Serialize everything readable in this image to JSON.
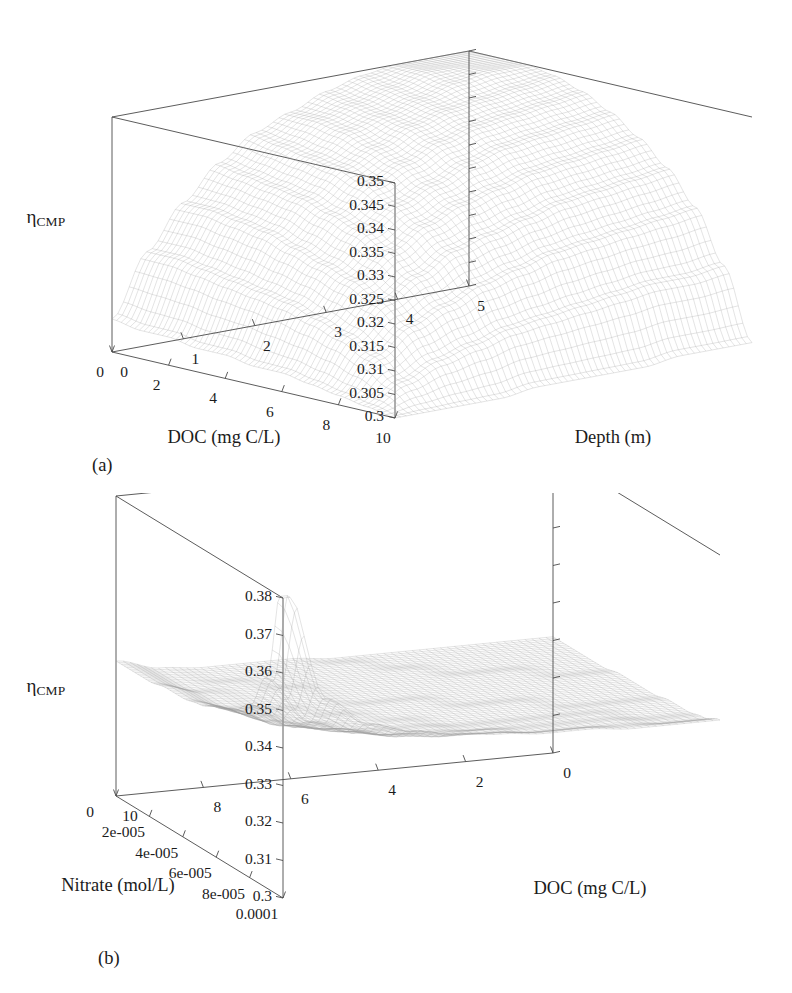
{
  "figure": {
    "background": "#ffffff",
    "ink": "#1b1b1b",
    "mesh_color": "#9a9a9a",
    "axis_color": "#4a4a4a"
  },
  "panels": [
    {
      "id": "a",
      "panel_label": "(a)",
      "z_axis_label_main": "η",
      "z_axis_label_sub": "CMP",
      "left_axis_title": "DOC (mg C/L)",
      "right_axis_title": "Depth (m)",
      "z_ticks": [
        "0.3",
        "0.305",
        "0.31",
        "0.315",
        "0.32",
        "0.325",
        "0.33",
        "0.335",
        "0.34",
        "0.345",
        "0.35"
      ],
      "left_ticks": [
        "10",
        "8",
        "6",
        "4",
        "2",
        "0"
      ],
      "right_ticks": [
        "0",
        "1",
        "2",
        "3",
        "4",
        "5"
      ],
      "chart_data": {
        "type": "surface",
        "title": "",
        "xlabel": "DOC (mg C/L)",
        "ylabel": "Depth (m)",
        "zlabel": "ηCMP",
        "xlim": [
          0,
          10
        ],
        "ylim": [
          0,
          5
        ],
        "zlim": [
          0.3,
          0.35
        ],
        "x_ticks": [
          0,
          2,
          4,
          6,
          8,
          10
        ],
        "y_ticks": [
          0,
          1,
          2,
          3,
          4,
          5
        ],
        "z_ticks": [
          0.3,
          0.305,
          0.31,
          0.315,
          0.32,
          0.325,
          0.33,
          0.335,
          0.34,
          0.345,
          0.35
        ],
        "grid": false,
        "legend": "none",
        "x": [
          0,
          1,
          2,
          3,
          4,
          5,
          6,
          7,
          8,
          9,
          10
        ],
        "y": [
          0,
          0.5,
          1,
          1.5,
          2,
          2.5,
          3,
          3.5,
          4,
          4.5,
          5
        ],
        "z_matrix_note": "rows = DOC (0..10), cols = Depth (0..5); eta_CMP rises from 0.300 at DOC=0,Depth=0 to ~0.350 at DOC=10,Depth=5",
        "z": [
          [
            0.3,
            0.3,
            0.3,
            0.3,
            0.301,
            0.301,
            0.301,
            0.301,
            0.302,
            0.302,
            0.302
          ],
          [
            0.301,
            0.305,
            0.308,
            0.31,
            0.312,
            0.313,
            0.314,
            0.315,
            0.316,
            0.316,
            0.317
          ],
          [
            0.302,
            0.309,
            0.314,
            0.317,
            0.32,
            0.322,
            0.324,
            0.325,
            0.326,
            0.327,
            0.328
          ],
          [
            0.303,
            0.312,
            0.318,
            0.322,
            0.326,
            0.328,
            0.33,
            0.332,
            0.333,
            0.334,
            0.335
          ],
          [
            0.304,
            0.314,
            0.321,
            0.326,
            0.33,
            0.333,
            0.335,
            0.337,
            0.338,
            0.339,
            0.34
          ],
          [
            0.304,
            0.316,
            0.323,
            0.329,
            0.333,
            0.336,
            0.339,
            0.341,
            0.342,
            0.343,
            0.344
          ],
          [
            0.305,
            0.317,
            0.325,
            0.331,
            0.336,
            0.339,
            0.342,
            0.344,
            0.345,
            0.346,
            0.347
          ],
          [
            0.305,
            0.318,
            0.327,
            0.333,
            0.338,
            0.341,
            0.344,
            0.346,
            0.347,
            0.348,
            0.349
          ],
          [
            0.306,
            0.319,
            0.328,
            0.334,
            0.339,
            0.343,
            0.345,
            0.347,
            0.349,
            0.35,
            0.35
          ],
          [
            0.306,
            0.32,
            0.329,
            0.335,
            0.34,
            0.344,
            0.346,
            0.348,
            0.35,
            0.35,
            0.35
          ],
          [
            0.307,
            0.32,
            0.329,
            0.336,
            0.341,
            0.344,
            0.347,
            0.349,
            0.35,
            0.35,
            0.35
          ]
        ]
      }
    },
    {
      "id": "b",
      "panel_label": "(b)",
      "z_axis_label_main": "η",
      "z_axis_label_sub": "CMP",
      "left_axis_title": "Nitrate (mol/L)",
      "right_axis_title": "DOC (mg C/L)",
      "z_ticks": [
        "0.3",
        "0.31",
        "0.32",
        "0.33",
        "0.34",
        "0.35",
        "0.36",
        "0.37",
        "0.38"
      ],
      "left_ticks": [
        "0.0001",
        "8e-005",
        "6e-005",
        "4e-005",
        "2e-005",
        "0"
      ],
      "right_ticks": [
        "10",
        "8",
        "6",
        "4",
        "2",
        "0"
      ],
      "chart_data": {
        "type": "surface",
        "title": "",
        "xlabel": "Nitrate (mol/L)",
        "ylabel": "DOC (mg C/L)",
        "zlabel": "ηCMP",
        "xlim": [
          0,
          0.0001
        ],
        "ylim": [
          0,
          10
        ],
        "zlim": [
          0.3,
          0.38
        ],
        "x_ticks": [
          0,
          2e-05,
          4e-05,
          6e-05,
          8e-05,
          0.0001
        ],
        "y_ticks": [
          0,
          2,
          4,
          6,
          8,
          10
        ],
        "z_ticks": [
          0.3,
          0.31,
          0.32,
          0.33,
          0.34,
          0.35,
          0.36,
          0.37,
          0.38
        ],
        "grid": false,
        "legend": "none",
        "x": [
          0,
          1e-05,
          2e-05,
          3e-05,
          4e-05,
          5e-05,
          6e-05,
          7e-05,
          8e-05,
          9e-05,
          0.0001
        ],
        "y": [
          0,
          1,
          2,
          3,
          4,
          5,
          6,
          7,
          8,
          9,
          10
        ],
        "z_matrix_note": "rows = Nitrate (0..1e-4), cols = DOC (0..10); sharp spike to ~0.385 at Nitrate=0, DOC=0; broad plateau near 0.332-0.340 elsewhere",
        "z": [
          [
            0.385,
            0.352,
            0.344,
            0.341,
            0.339,
            0.338,
            0.337,
            0.337,
            0.336,
            0.336,
            0.336
          ],
          [
            0.356,
            0.343,
            0.339,
            0.337,
            0.336,
            0.336,
            0.335,
            0.335,
            0.335,
            0.334,
            0.334
          ],
          [
            0.346,
            0.339,
            0.337,
            0.335,
            0.335,
            0.334,
            0.334,
            0.334,
            0.334,
            0.333,
            0.333
          ],
          [
            0.342,
            0.337,
            0.335,
            0.334,
            0.334,
            0.333,
            0.333,
            0.333,
            0.333,
            0.333,
            0.333
          ],
          [
            0.34,
            0.336,
            0.334,
            0.334,
            0.333,
            0.333,
            0.333,
            0.333,
            0.332,
            0.332,
            0.332
          ],
          [
            0.338,
            0.335,
            0.334,
            0.333,
            0.333,
            0.333,
            0.332,
            0.332,
            0.332,
            0.332,
            0.332
          ],
          [
            0.337,
            0.334,
            0.333,
            0.333,
            0.332,
            0.332,
            0.332,
            0.332,
            0.332,
            0.332,
            0.332
          ],
          [
            0.337,
            0.334,
            0.333,
            0.333,
            0.332,
            0.332,
            0.332,
            0.332,
            0.332,
            0.331,
            0.331
          ],
          [
            0.336,
            0.333,
            0.333,
            0.332,
            0.332,
            0.332,
            0.332,
            0.331,
            0.331,
            0.331,
            0.331
          ],
          [
            0.336,
            0.333,
            0.332,
            0.332,
            0.332,
            0.332,
            0.331,
            0.331,
            0.331,
            0.331,
            0.331
          ],
          [
            0.336,
            0.333,
            0.332,
            0.332,
            0.332,
            0.331,
            0.331,
            0.331,
            0.331,
            0.331,
            0.331
          ]
        ]
      }
    }
  ]
}
